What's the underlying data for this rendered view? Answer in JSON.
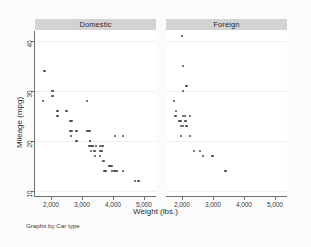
{
  "caption": "Graphs by Car type",
  "colors": {
    "marker": "#4a4a52",
    "panel_header_bg": "#d3d3d3",
    "axis": "#6f6f6f",
    "grid": "#f0f0f0",
    "plot_bg": "#ffffff",
    "page_bg": "#fbfbfb"
  },
  "chart_data": {
    "type": "scatter",
    "title": "",
    "xlabel": "Weight (lbs.)",
    "ylabel": "Mileage (mpg)",
    "xlim": [
      1500,
      5400
    ],
    "ylim": [
      9,
      42
    ],
    "xticks": [
      2000,
      3000,
      4000,
      5000
    ],
    "xticklabels": [
      "2,000",
      "3,000",
      "4,000",
      "5,000"
    ],
    "yticks": [
      10,
      20,
      30,
      40
    ],
    "yticklabels": [
      "10",
      "20",
      "30",
      "40"
    ],
    "grid": "horizontal",
    "legend": "none",
    "panel_by": "Car type",
    "panels": [
      {
        "label": "Domestic",
        "points": [
          [
            1800,
            34
          ],
          [
            1760,
            28
          ],
          [
            2070,
            30
          ],
          [
            2070,
            29
          ],
          [
            2230,
            26
          ],
          [
            2230,
            25
          ],
          [
            2520,
            26
          ],
          [
            2650,
            24
          ],
          [
            2670,
            24
          ],
          [
            2640,
            22
          ],
          [
            2670,
            22
          ],
          [
            2660,
            21
          ],
          [
            2830,
            22
          ],
          [
            2830,
            20
          ],
          [
            3180,
            28
          ],
          [
            3200,
            22
          ],
          [
            3250,
            22
          ],
          [
            3280,
            20
          ],
          [
            3280,
            20
          ],
          [
            3250,
            19
          ],
          [
            3300,
            19
          ],
          [
            3330,
            19
          ],
          [
            3360,
            19
          ],
          [
            3310,
            18
          ],
          [
            3420,
            18
          ],
          [
            3470,
            19
          ],
          [
            3600,
            19
          ],
          [
            3670,
            19
          ],
          [
            3600,
            18
          ],
          [
            3640,
            18
          ],
          [
            3430,
            17
          ],
          [
            3600,
            17
          ],
          [
            3690,
            16
          ],
          [
            3720,
            16
          ],
          [
            3740,
            14
          ],
          [
            3780,
            14
          ],
          [
            3900,
            15
          ],
          [
            3960,
            15
          ],
          [
            3980,
            14
          ],
          [
            4060,
            14
          ],
          [
            4130,
            14
          ],
          [
            4080,
            21
          ],
          [
            4330,
            21
          ],
          [
            4330,
            14
          ],
          [
            4720,
            12
          ],
          [
            4840,
            12
          ]
        ]
      },
      {
        "label": "Foreign",
        "points": [
          [
            2020,
            41
          ],
          [
            2040,
            35
          ],
          [
            2160,
            31
          ],
          [
            2040,
            30
          ],
          [
            1760,
            28
          ],
          [
            1830,
            26
          ],
          [
            1800,
            25
          ],
          [
            2050,
            25
          ],
          [
            2120,
            25
          ],
          [
            2280,
            25
          ],
          [
            1930,
            24
          ],
          [
            1990,
            24
          ],
          [
            2130,
            24
          ],
          [
            1990,
            23
          ],
          [
            2050,
            23
          ],
          [
            2160,
            23
          ],
          [
            1980,
            21
          ],
          [
            2280,
            21
          ],
          [
            2400,
            18
          ],
          [
            2590,
            18
          ],
          [
            2700,
            17
          ],
          [
            3000,
            17
          ],
          [
            3420,
            14
          ]
        ]
      }
    ]
  }
}
